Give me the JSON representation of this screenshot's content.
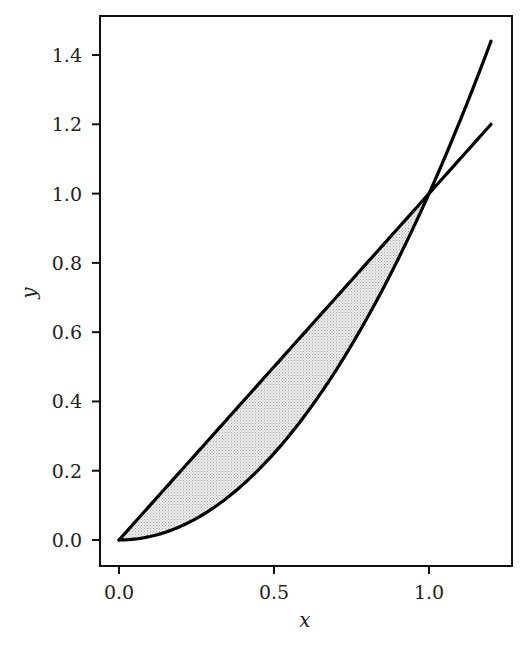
{
  "chart_data": {
    "type": "line",
    "title": "",
    "xlabel": "x",
    "ylabel": "y",
    "xlim": [
      -0.06,
      1.26
    ],
    "ylim": [
      -0.075,
      1.52
    ],
    "grid": false,
    "legend": null,
    "x_ticks": [
      0.0,
      0.5,
      1.0
    ],
    "x_tick_labels": [
      "0.0",
      "0.5",
      "1.0"
    ],
    "y_ticks": [
      0.0,
      0.2,
      0.4,
      0.6,
      0.8,
      1.0,
      1.2,
      1.4
    ],
    "y_tick_labels": [
      "0.0",
      "0.2",
      "0.4",
      "0.6",
      "0.8",
      "1.0",
      "1.2",
      "1.4"
    ],
    "series": [
      {
        "name": "y = x",
        "function": "x",
        "x_range": [
          0,
          1.2
        ],
        "color": "#000000"
      },
      {
        "name": "y = x^2",
        "function": "x^2",
        "x_range": [
          0,
          1.2
        ],
        "color": "#000000"
      }
    ],
    "fill_between": {
      "x_range": [
        0,
        1
      ],
      "upper": "x",
      "lower": "x^2",
      "color": "#d9d9d9",
      "hatch": "dotted"
    },
    "annotations": []
  },
  "axes": {
    "x_label": "x",
    "y_label": "y"
  }
}
